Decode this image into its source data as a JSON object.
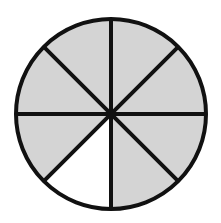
{
  "diagram": {
    "type": "fraction-circle",
    "total_slices": 8,
    "shaded_slices": 7,
    "unshaded_slices": 1,
    "fraction_shaded": "7/8",
    "unshaded_slice_position": "between 6 o'clock and 7:30 (lower-left)",
    "center": [
      111,
      114
    ],
    "radius": 95,
    "colors": {
      "background": "#ffffff",
      "shaded_fill": "#d4d4d4",
      "unshaded_fill": "#ffffff",
      "stroke": "#111111"
    },
    "stroke_width": 4
  }
}
